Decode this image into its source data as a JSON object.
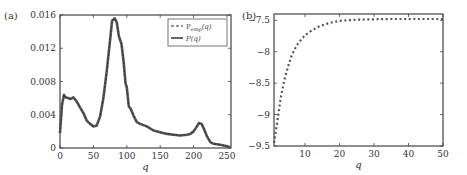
{
  "chart_data": [
    {
      "panel": "(a)",
      "type": "line",
      "xlabel": "q",
      "ylabel": "",
      "xlim": [
        0,
        256
      ],
      "ylim": [
        0,
        0.016
      ],
      "xticks": [
        0,
        50,
        100,
        150,
        200,
        250
      ],
      "yticks": [
        0,
        0.004,
        0.008,
        0.012,
        0.016
      ],
      "ytick_labels": [
        "0",
        "0.004",
        "0.008",
        "0.012",
        "0.016"
      ],
      "legend": {
        "position": "upper right",
        "entries": [
          "P_emp(q)",
          "P(q)"
        ]
      },
      "series": [
        {
          "name": "P_emp(q)",
          "style": "dashed",
          "x": [
            0,
            3,
            6,
            8,
            12,
            16,
            20,
            25,
            30,
            35,
            40,
            45,
            50,
            55,
            60,
            65,
            70,
            75,
            78,
            82,
            85,
            88,
            92,
            95,
            98,
            100,
            103,
            106,
            110,
            115,
            120,
            130,
            140,
            150,
            160,
            170,
            180,
            190,
            195,
            200,
            205,
            208,
            212,
            215,
            220,
            225,
            230,
            240,
            250,
            255
          ],
          "y": [
            0.0018,
            0.0052,
            0.0064,
            0.0061,
            0.006,
            0.0059,
            0.0061,
            0.0056,
            0.0049,
            0.0042,
            0.0033,
            0.0029,
            0.0026,
            0.0027,
            0.0038,
            0.006,
            0.0093,
            0.013,
            0.0153,
            0.0156,
            0.0151,
            0.0135,
            0.0125,
            0.0105,
            0.0078,
            0.0073,
            0.005,
            0.0047,
            0.0039,
            0.0031,
            0.0029,
            0.0026,
            0.0021,
            0.0019,
            0.0017,
            0.0016,
            0.0015,
            0.0016,
            0.0017,
            0.002,
            0.0026,
            0.003,
            0.0029,
            0.0024,
            0.0014,
            0.0007,
            0.0005,
            0.0004,
            0.0002,
            0.0001
          ]
        },
        {
          "name": "P(q)",
          "style": "solid",
          "x": [
            0,
            3,
            6,
            8,
            12,
            16,
            20,
            25,
            30,
            35,
            40,
            45,
            50,
            55,
            60,
            65,
            70,
            75,
            78,
            82,
            85,
            88,
            92,
            95,
            98,
            100,
            103,
            106,
            110,
            115,
            120,
            130,
            140,
            150,
            160,
            170,
            180,
            190,
            195,
            200,
            205,
            208,
            212,
            215,
            220,
            225,
            230,
            240,
            250,
            255
          ],
          "y": [
            0.0018,
            0.0052,
            0.0064,
            0.0061,
            0.006,
            0.0059,
            0.0061,
            0.0056,
            0.0049,
            0.0042,
            0.0033,
            0.0029,
            0.0026,
            0.0027,
            0.0038,
            0.006,
            0.0093,
            0.013,
            0.0153,
            0.0156,
            0.0151,
            0.0135,
            0.0125,
            0.0105,
            0.0078,
            0.0073,
            0.005,
            0.0047,
            0.0039,
            0.0031,
            0.0029,
            0.0026,
            0.0021,
            0.0019,
            0.0017,
            0.0016,
            0.0015,
            0.0016,
            0.0017,
            0.002,
            0.0026,
            0.003,
            0.0029,
            0.0024,
            0.0014,
            0.0007,
            0.0005,
            0.0004,
            0.0002,
            0.0001
          ]
        }
      ]
    },
    {
      "panel": "(b)",
      "type": "line",
      "xlabel": "q",
      "ylabel": "",
      "xlim": [
        1,
        50
      ],
      "ylim": [
        -9.5,
        -7.4
      ],
      "xticks": [
        10,
        20,
        30,
        40,
        50
      ],
      "yticks": [
        -9.5,
        -9,
        -8.5,
        -8,
        -7.5
      ],
      "ytick_labels": [
        "−9.5",
        "−9",
        "−8.5",
        "−8",
        "−7.5"
      ],
      "series": [
        {
          "name": "dotted curve",
          "style": "dotted",
          "x": [
            1,
            2,
            3,
            4,
            5,
            6,
            7,
            8,
            9,
            10,
            12,
            14,
            16,
            18,
            20,
            22,
            25,
            30,
            35,
            40,
            45,
            50
          ],
          "y": [
            -9.45,
            -9.1,
            -8.72,
            -8.45,
            -8.25,
            -8.08,
            -7.96,
            -7.87,
            -7.8,
            -7.74,
            -7.66,
            -7.6,
            -7.56,
            -7.53,
            -7.51,
            -7.5,
            -7.49,
            -7.485,
            -7.48,
            -7.48,
            -7.48,
            -7.48
          ]
        }
      ]
    }
  ],
  "labels": {
    "panel_a": "(a)",
    "panel_b": "(b)",
    "xaxis_a": "q",
    "xaxis_b": "q",
    "legend_emp_main": "P",
    "legend_emp_sub": "emp",
    "legend_emp_arg": "(q)",
    "legend_model": "P(q)"
  }
}
